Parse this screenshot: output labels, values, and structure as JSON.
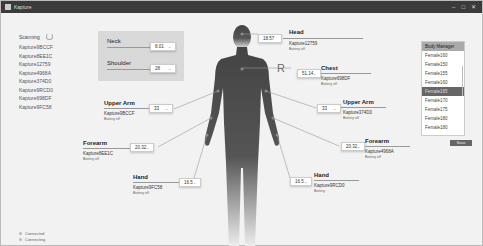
{
  "window": {
    "title": "Kapture",
    "controls": [
      "–",
      "□",
      "✕"
    ]
  },
  "scanner": {
    "label": "Scanning",
    "devices": [
      "Kapture9BCCF",
      "Kapture8EE1C",
      "Kapture12759",
      "Kapture4968A",
      "Kapture374D0",
      "Kapture9RCD0",
      "Kapture698DF",
      "Kapture9FC58"
    ]
  },
  "status": {
    "connected": "Connected",
    "connecting": "Connecting"
  },
  "neck_panel": {
    "neck": {
      "label": "Neck",
      "value": "8.01"
    },
    "shoulder": {
      "label": "Shoulder",
      "value": "28"
    }
  },
  "sides": {
    "left": "L",
    "right": "R"
  },
  "segments": {
    "head": {
      "label": "Head",
      "value": "18.57",
      "device": "Kapture12759",
      "battery": "Battery off"
    },
    "chest": {
      "label": "Chest",
      "value": "51.14",
      "device": "Kapture698DF",
      "battery": "Battery off"
    },
    "upper_arm_left": {
      "label": "Upper Arm",
      "value": "33",
      "device": "Kapture9BCCF",
      "battery": "Battery off"
    },
    "upper_arm_right": {
      "label": "Upper Arm",
      "value": "33",
      "device": "Kapture374D0",
      "battery": "Battery off"
    },
    "forearm_left": {
      "label": "Forearm",
      "value": "20.32",
      "device": "Kapture8EE1C",
      "battery": "Battery off"
    },
    "forearm_right": {
      "label": "Forearm",
      "value": "20.32",
      "device": "Kapture4968A",
      "battery": "Battery off"
    },
    "hand_left": {
      "label": "Hand",
      "value": "16.5",
      "device": "Kapture9FC58",
      "battery": "Battery off"
    },
    "hand_right": {
      "label": "Hand",
      "value": "16.5",
      "device": "Kapture9RCD0",
      "battery": "Battery"
    }
  },
  "body_manager": {
    "title": "Body Manager",
    "items": [
      "Female160",
      "Female150",
      "Female155",
      "Female160",
      "Female165",
      "Female170",
      "Female175",
      "Female180",
      "Female180"
    ],
    "selected_index": 4,
    "save_label": "Save"
  }
}
